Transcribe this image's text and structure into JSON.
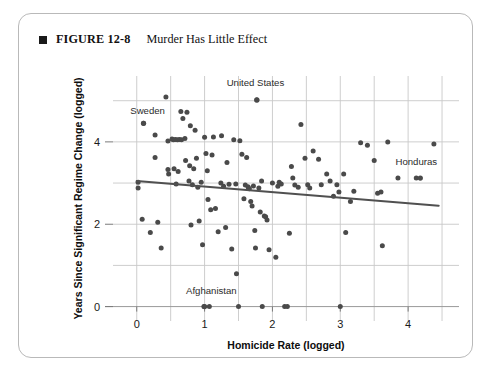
{
  "figure": {
    "bullet_icon": "filled-square-icon",
    "figure_number": "FIGURE 12-8",
    "title": "Murder Has Little Effect"
  },
  "chart_data": {
    "type": "scatter",
    "title": "Murder Has Little Effect",
    "xlabel": "Homicide Rate (logged)",
    "ylabel": "Years Since Significant Regime Change (logged)",
    "xlim": [
      -0.35,
      4.75
    ],
    "ylim": [
      -0.35,
      5.6
    ],
    "xticks": [
      0,
      1,
      2,
      3,
      4
    ],
    "xtick_labels": [
      "0",
      "1",
      "2",
      "3",
      "4"
    ],
    "yticks": [
      0,
      2,
      4
    ],
    "ytick_labels": [
      "0",
      "2",
      "4"
    ],
    "x_minor_gridlines": [
      0.5,
      1.5,
      2.5,
      3.5,
      4.5
    ],
    "y_minor_gridlines": [
      1,
      3,
      5
    ],
    "grid": true,
    "legend": "none",
    "annotations": [
      {
        "text": "United States",
        "x": 1.75,
        "y": 5.35,
        "point_x": 1.77,
        "point_y": 5.02
      },
      {
        "text": "Sweden",
        "x": 0.16,
        "y": 4.67,
        "point_x": 0.1,
        "point_y": 4.45
      },
      {
        "text": "Honduras",
        "x": 4.12,
        "y": 3.45,
        "point_x": 4.18,
        "point_y": 3.12
      },
      {
        "text": "Afghanistan",
        "x": 1.1,
        "y": 0.3,
        "point_x": 1.0,
        "point_y": 0.0
      }
    ],
    "trendline": {
      "x": [
        0.0,
        4.45
      ],
      "y": [
        3.05,
        2.45
      ],
      "slope": -0.135,
      "intercept": 3.05
    },
    "points": [
      [
        0.1,
        4.45
      ],
      [
        0.02,
        3.02
      ],
      [
        0.02,
        2.88
      ],
      [
        0.08,
        2.12
      ],
      [
        0.2,
        1.8
      ],
      [
        0.27,
        4.17
      ],
      [
        0.27,
        3.62
      ],
      [
        0.31,
        2.05
      ],
      [
        0.36,
        1.42
      ],
      [
        0.43,
        5.09
      ],
      [
        0.46,
        4.02
      ],
      [
        0.46,
        3.33
      ],
      [
        0.47,
        3.22
      ],
      [
        0.52,
        4.07
      ],
      [
        0.54,
        4.05
      ],
      [
        0.55,
        3.35
      ],
      [
        0.57,
        4.06
      ],
      [
        0.58,
        2.98
      ],
      [
        0.6,
        4.05
      ],
      [
        0.61,
        3.28
      ],
      [
        0.63,
        4.06
      ],
      [
        0.65,
        4.74
      ],
      [
        0.66,
        4.05
      ],
      [
        0.68,
        4.57
      ],
      [
        0.71,
        4.08
      ],
      [
        0.72,
        3.55
      ],
      [
        0.74,
        4.72
      ],
      [
        0.77,
        3.05
      ],
      [
        0.78,
        3.42
      ],
      [
        0.79,
        4.39
      ],
      [
        0.8,
        1.98
      ],
      [
        0.82,
        2.96
      ],
      [
        0.84,
        3.35
      ],
      [
        0.86,
        4.28
      ],
      [
        0.88,
        3.6
      ],
      [
        0.9,
        2.9
      ],
      [
        0.92,
        2.08
      ],
      [
        0.95,
        3.02
      ],
      [
        0.97,
        1.5
      ],
      [
        0.99,
        0.0
      ],
      [
        1.0,
        4.11
      ],
      [
        1.02,
        3.72
      ],
      [
        1.04,
        3.3
      ],
      [
        1.05,
        2.6
      ],
      [
        1.07,
        0.0
      ],
      [
        1.09,
        2.35
      ],
      [
        1.11,
        3.68
      ],
      [
        1.13,
        4.12
      ],
      [
        1.16,
        2.38
      ],
      [
        1.2,
        1.82
      ],
      [
        1.24,
        3.0
      ],
      [
        1.25,
        4.15
      ],
      [
        1.28,
        2.92
      ],
      [
        1.31,
        1.92
      ],
      [
        1.33,
        3.5
      ],
      [
        1.36,
        2.97
      ],
      [
        1.4,
        1.4
      ],
      [
        1.43,
        4.05
      ],
      [
        1.46,
        2.98
      ],
      [
        1.47,
        0.8
      ],
      [
        1.5,
        0.0
      ],
      [
        1.52,
        4.03
      ],
      [
        1.55,
        3.7
      ],
      [
        1.58,
        2.62
      ],
      [
        1.6,
        2.95
      ],
      [
        1.62,
        3.62
      ],
      [
        1.64,
        2.91
      ],
      [
        1.65,
        2.87
      ],
      [
        1.66,
        2.86
      ],
      [
        1.68,
        2.55
      ],
      [
        1.7,
        2.44
      ],
      [
        1.72,
        2.93
      ],
      [
        1.74,
        1.85
      ],
      [
        1.75,
        1.42
      ],
      [
        1.77,
        5.02
      ],
      [
        1.8,
        2.88
      ],
      [
        1.82,
        2.3
      ],
      [
        1.84,
        3.05
      ],
      [
        1.85,
        0.0
      ],
      [
        1.88,
        2.2
      ],
      [
        1.9,
        2.18
      ],
      [
        1.92,
        2.1
      ],
      [
        1.95,
        1.38
      ],
      [
        2.0,
        3.0
      ],
      [
        2.05,
        1.2
      ],
      [
        2.08,
        2.92
      ],
      [
        2.1,
        3.02
      ],
      [
        2.13,
        2.98
      ],
      [
        2.18,
        0.0
      ],
      [
        2.22,
        0.0
      ],
      [
        2.25,
        1.78
      ],
      [
        2.28,
        3.4
      ],
      [
        2.3,
        3.12
      ],
      [
        2.33,
        2.95
      ],
      [
        2.38,
        2.9
      ],
      [
        2.42,
        4.42
      ],
      [
        2.48,
        3.6
      ],
      [
        2.52,
        2.96
      ],
      [
        2.55,
        2.88
      ],
      [
        2.6,
        3.78
      ],
      [
        2.68,
        3.58
      ],
      [
        2.72,
        2.96
      ],
      [
        2.8,
        3.22
      ],
      [
        2.85,
        3.05
      ],
      [
        2.9,
        2.68
      ],
      [
        2.95,
        2.96
      ],
      [
        2.98,
        2.78
      ],
      [
        3.0,
        0.0
      ],
      [
        3.05,
        3.22
      ],
      [
        3.08,
        1.8
      ],
      [
        3.15,
        2.55
      ],
      [
        3.2,
        2.8
      ],
      [
        3.3,
        3.98
      ],
      [
        3.4,
        3.92
      ],
      [
        3.5,
        3.55
      ],
      [
        3.55,
        2.75
      ],
      [
        3.6,
        2.78
      ],
      [
        3.62,
        1.48
      ],
      [
        3.7,
        4.0
      ],
      [
        3.85,
        3.12
      ],
      [
        4.12,
        3.12
      ],
      [
        4.38,
        3.95
      ]
    ]
  }
}
